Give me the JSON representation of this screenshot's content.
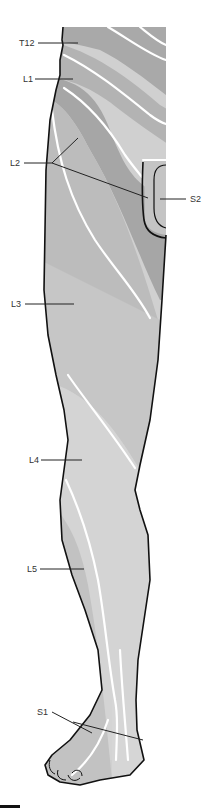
{
  "diagram": {
    "colors": {
      "skin_dark": "#a9a9a9",
      "skin_mid": "#bdbdbd",
      "skin_light": "#d0d0d0",
      "skin_lightest": "#dcdcdc",
      "outline": "#111111",
      "boundary": "#ffffff",
      "label_text": "#333333"
    },
    "labels": [
      {
        "id": "T12",
        "text": "T12"
      },
      {
        "id": "L1",
        "text": "L1"
      },
      {
        "id": "L2",
        "text": "L2"
      },
      {
        "id": "S2",
        "text": "S2"
      },
      {
        "id": "L3",
        "text": "L3"
      },
      {
        "id": "L4",
        "text": "L4"
      },
      {
        "id": "L5",
        "text": "L5"
      },
      {
        "id": "S1",
        "text": "S1"
      }
    ]
  }
}
